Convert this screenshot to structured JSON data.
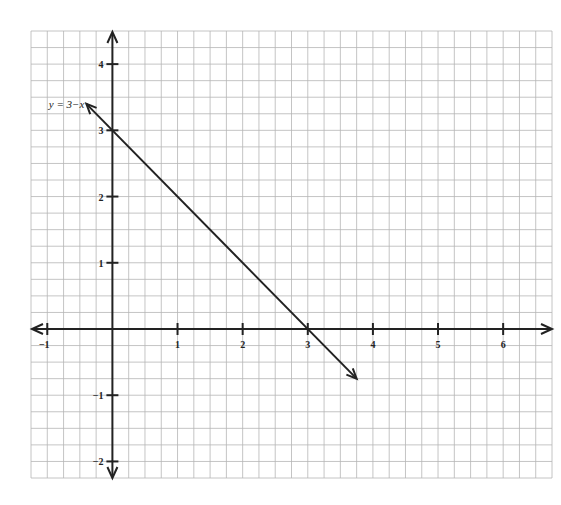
{
  "chart_data": {
    "type": "line",
    "title": "",
    "xlabel": "",
    "ylabel": "",
    "xlim": [
      -1.25,
      6.75
    ],
    "ylim": [
      -2.25,
      4.5
    ],
    "grid": true,
    "grid_step": 0.25,
    "x_ticks": [
      -1,
      1,
      2,
      3,
      4,
      5,
      6
    ],
    "y_ticks": [
      -2,
      -1,
      1,
      2,
      3,
      4
    ],
    "x_tick_labels": [
      "−1",
      "1",
      "2",
      "3",
      "4",
      "5",
      "6"
    ],
    "y_tick_labels": [
      "−2",
      "−1",
      "1",
      "2",
      "3",
      "4"
    ],
    "series": [
      {
        "name": "y = 3−x",
        "equation": "y = 3 - x",
        "x": [
          -0.4,
          0,
          3,
          3.75
        ],
        "y": [
          3.4,
          3,
          0,
          -0.75
        ],
        "arrows": "both"
      }
    ],
    "annotations": [
      {
        "text": "y = 3−x",
        "x": -0.75,
        "y": 3.4
      }
    ]
  },
  "colors": {
    "grid": "#b5b5b5",
    "axis": "#222222",
    "line": "#222222"
  }
}
